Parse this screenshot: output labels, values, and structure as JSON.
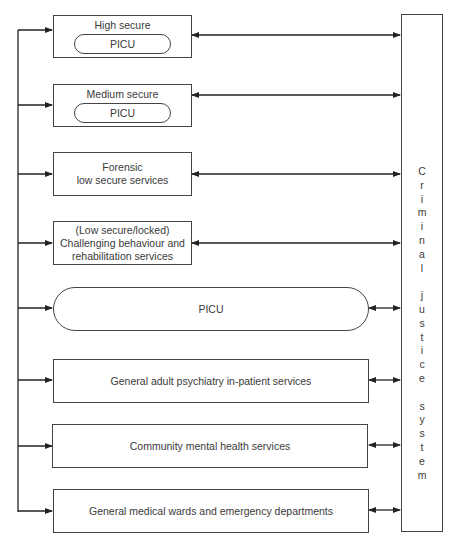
{
  "diagram": {
    "services": [
      {
        "label_lines": [
          "High secure"
        ],
        "inner": "PICU",
        "type": "small"
      },
      {
        "label_lines": [
          "Medium secure"
        ],
        "inner": "PICU",
        "type": "small"
      },
      {
        "label_lines": [
          "Forensic",
          "low secure services"
        ],
        "type": "small"
      },
      {
        "label_lines": [
          "(Low secure/locked)",
          "Challenging behaviour and",
          "rehabilitation services"
        ],
        "type": "small"
      },
      {
        "label_lines": [
          "PICU"
        ],
        "type": "large-rounded"
      },
      {
        "label_lines": [
          "General adult psychiatry in-patient services"
        ],
        "type": "large"
      },
      {
        "label_lines": [
          "Community mental health services"
        ],
        "type": "large"
      },
      {
        "label_lines": [
          "General medical wards and emergency departments"
        ],
        "type": "large"
      }
    ],
    "side_system": {
      "label": "Criminal justice system",
      "letters": [
        "C",
        "r",
        "i",
        "m",
        "i",
        "n",
        "a",
        "l",
        "",
        "j",
        "u",
        "s",
        "t",
        "i",
        "c",
        "e",
        "",
        "s",
        "y",
        "s",
        "t",
        "e",
        "m"
      ]
    },
    "colors": {
      "line": "#222222",
      "border": "#444444",
      "text": "#3a3a3a"
    }
  }
}
